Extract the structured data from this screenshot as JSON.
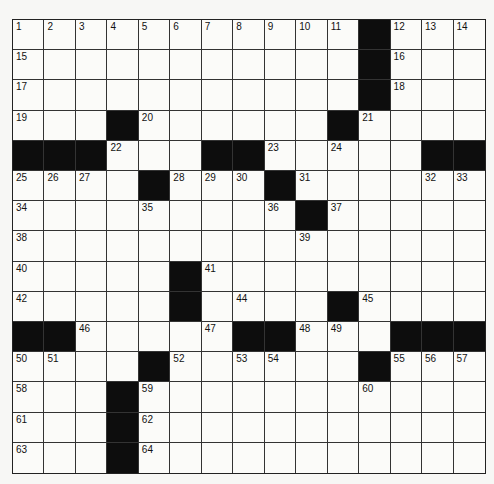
{
  "puzzle": {
    "rows": 15,
    "cols": 15,
    "colors": {
      "block": "#0d0d0d",
      "cell": "#fbfbf9",
      "line": "#333333"
    },
    "grid": [
      "...........#...",
      "...........#...",
      "...........#...",
      "...#......#....",
      "###...##.....##",
      "....#...#......",
      ".........#.....",
      "...............",
      ".....#.........",
      ".....#....#....",
      "##.....##...###",
      "....#......#...",
      "...#...........",
      "...#...........",
      "...#..........."
    ],
    "numbers": [
      [
        1,
        2,
        3,
        4,
        5,
        6,
        7,
        8,
        9,
        10,
        11,
        0,
        12,
        13,
        14
      ],
      [
        15,
        0,
        0,
        0,
        0,
        0,
        0,
        0,
        0,
        0,
        0,
        0,
        16,
        0,
        0
      ],
      [
        17,
        0,
        0,
        0,
        0,
        0,
        0,
        0,
        0,
        0,
        0,
        0,
        18,
        0,
        0
      ],
      [
        19,
        0,
        0,
        0,
        20,
        0,
        0,
        0,
        0,
        0,
        0,
        21,
        0,
        0,
        0
      ],
      [
        0,
        0,
        0,
        22,
        0,
        0,
        0,
        0,
        23,
        0,
        24,
        0,
        0,
        0,
        0
      ],
      [
        25,
        26,
        27,
        0,
        0,
        28,
        29,
        30,
        0,
        31,
        0,
        0,
        0,
        32,
        33
      ],
      [
        34,
        0,
        0,
        0,
        35,
        0,
        0,
        0,
        36,
        0,
        37,
        0,
        0,
        0,
        0
      ],
      [
        38,
        0,
        0,
        0,
        0,
        0,
        0,
        0,
        0,
        39,
        0,
        0,
        0,
        0,
        0
      ],
      [
        40,
        0,
        0,
        0,
        0,
        0,
        41,
        0,
        0,
        0,
        0,
        0,
        0,
        0,
        0
      ],
      [
        42,
        0,
        0,
        0,
        0,
        43,
        0,
        44,
        0,
        0,
        0,
        45,
        0,
        0,
        0
      ],
      [
        0,
        0,
        46,
        0,
        0,
        0,
        47,
        0,
        0,
        48,
        49,
        0,
        0,
        0,
        0
      ],
      [
        50,
        51,
        0,
        0,
        0,
        52,
        0,
        53,
        54,
        0,
        0,
        0,
        55,
        56,
        57
      ],
      [
        58,
        0,
        0,
        0,
        59,
        0,
        0,
        0,
        0,
        0,
        0,
        60,
        0,
        0,
        0
      ],
      [
        61,
        0,
        0,
        0,
        62,
        0,
        0,
        0,
        0,
        0,
        0,
        0,
        0,
        0,
        0
      ],
      [
        63,
        0,
        0,
        0,
        64,
        0,
        0,
        0,
        0,
        0,
        0,
        0,
        0,
        0,
        0
      ]
    ]
  }
}
